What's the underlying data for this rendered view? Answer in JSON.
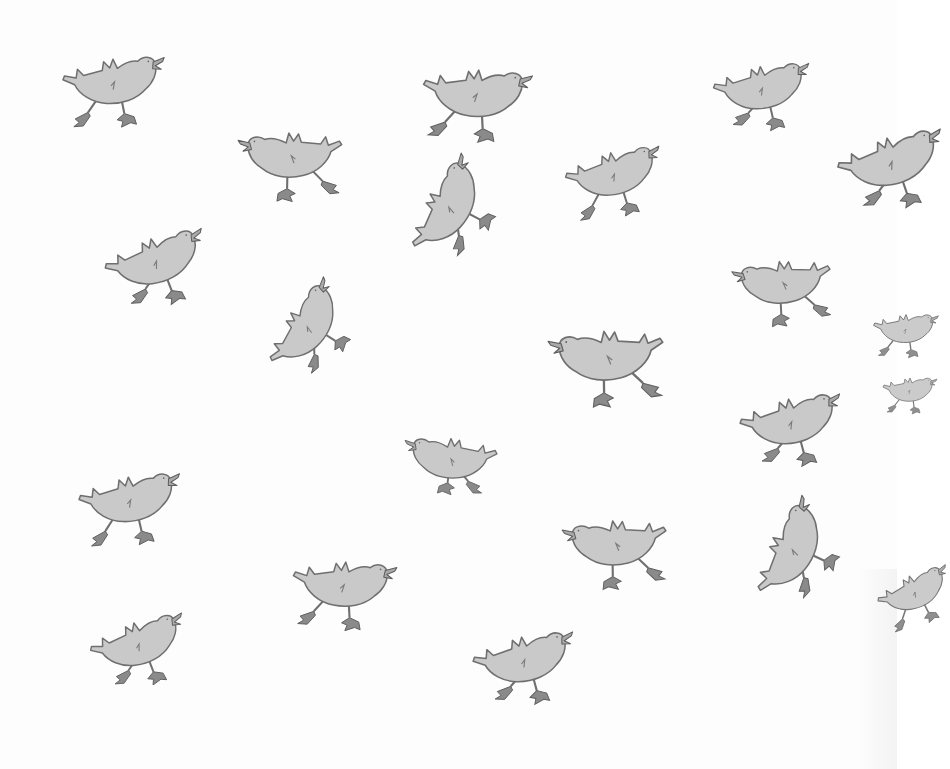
{
  "image": {
    "description": "Illustration of a flock of grey cartoon ducks in assorted poses scattered across a white page",
    "background_color": "#fdfdfd",
    "body_color": "#c9c9c9",
    "outline_color": "#6f6f6f",
    "feet_color": "#8a8a8a"
  },
  "ducks": [
    {
      "id": "duck-1",
      "x": 55,
      "y": 48,
      "scale": 0.95,
      "rotate": -4,
      "flip": false,
      "pose": "running"
    },
    {
      "id": "duck-2",
      "x": 230,
      "y": 112,
      "scale": 0.95,
      "rotate": 6,
      "flip": true,
      "pose": "running"
    },
    {
      "id": "duck-3",
      "x": 420,
      "y": 50,
      "scale": 1.0,
      "rotate": 4,
      "flip": false,
      "pose": "running"
    },
    {
      "id": "duck-4",
      "x": 705,
      "y": 58,
      "scale": 0.9,
      "rotate": -6,
      "flip": false,
      "pose": "standing"
    },
    {
      "id": "duck-5",
      "x": 555,
      "y": 148,
      "scale": 0.9,
      "rotate": -10,
      "flip": false,
      "pose": "running"
    },
    {
      "id": "duck-6",
      "x": 825,
      "y": 135,
      "scale": 1.0,
      "rotate": -12,
      "flip": false,
      "pose": "standing"
    },
    {
      "id": "duck-7",
      "x": 92,
      "y": 238,
      "scale": 0.95,
      "rotate": -14,
      "flip": false,
      "pose": "standing"
    },
    {
      "id": "duck-8",
      "x": 385,
      "y": 232,
      "scale": 0.95,
      "rotate": -55,
      "flip": false,
      "pose": "standing"
    },
    {
      "id": "duck-9",
      "x": 722,
      "y": 238,
      "scale": 0.9,
      "rotate": 10,
      "flip": true,
      "pose": "running"
    },
    {
      "id": "duck-10",
      "x": 538,
      "y": 306,
      "scale": 1.05,
      "rotate": 8,
      "flip": true,
      "pose": "running"
    },
    {
      "id": "duck-11",
      "x": 245,
      "y": 345,
      "scale": 0.9,
      "rotate": -50,
      "flip": false,
      "pose": "standing"
    },
    {
      "id": "duck-12",
      "x": 400,
      "y": 425,
      "scale": 0.85,
      "rotate": 0,
      "flip": true,
      "pose": "sitting"
    },
    {
      "id": "duck-13",
      "x": 730,
      "y": 392,
      "scale": 0.95,
      "rotate": -8,
      "flip": false,
      "pose": "standing"
    },
    {
      "id": "duck-14",
      "x": 70,
      "y": 468,
      "scale": 0.95,
      "rotate": -6,
      "flip": false,
      "pose": "running"
    },
    {
      "id": "duck-15",
      "x": 553,
      "y": 498,
      "scale": 0.95,
      "rotate": 8,
      "flip": true,
      "pose": "running"
    },
    {
      "id": "duck-16",
      "x": 290,
      "y": 543,
      "scale": 0.95,
      "rotate": 4,
      "flip": false,
      "pose": "running"
    },
    {
      "id": "duck-17",
      "x": 78,
      "y": 622,
      "scale": 0.9,
      "rotate": -14,
      "flip": false,
      "pose": "standing"
    },
    {
      "id": "duck-18",
      "x": 463,
      "y": 630,
      "scale": 0.95,
      "rotate": -8,
      "flip": false,
      "pose": "standing"
    },
    {
      "id": "duck-19",
      "x": 730,
      "y": 578,
      "scale": 0.95,
      "rotate": -58,
      "flip": false,
      "pose": "standing"
    },
    {
      "id": "duck-20",
      "x": 866,
      "y": 580,
      "scale": 0.7,
      "rotate": -20,
      "flip": false,
      "pose": "partial"
    },
    {
      "id": "duck-21",
      "x": 870,
      "y": 305,
      "scale": 0.6,
      "rotate": 0,
      "flip": false,
      "pose": "partial"
    },
    {
      "id": "duck-22",
      "x": 880,
      "y": 370,
      "scale": 0.5,
      "rotate": 0,
      "flip": false,
      "pose": "partial"
    }
  ]
}
